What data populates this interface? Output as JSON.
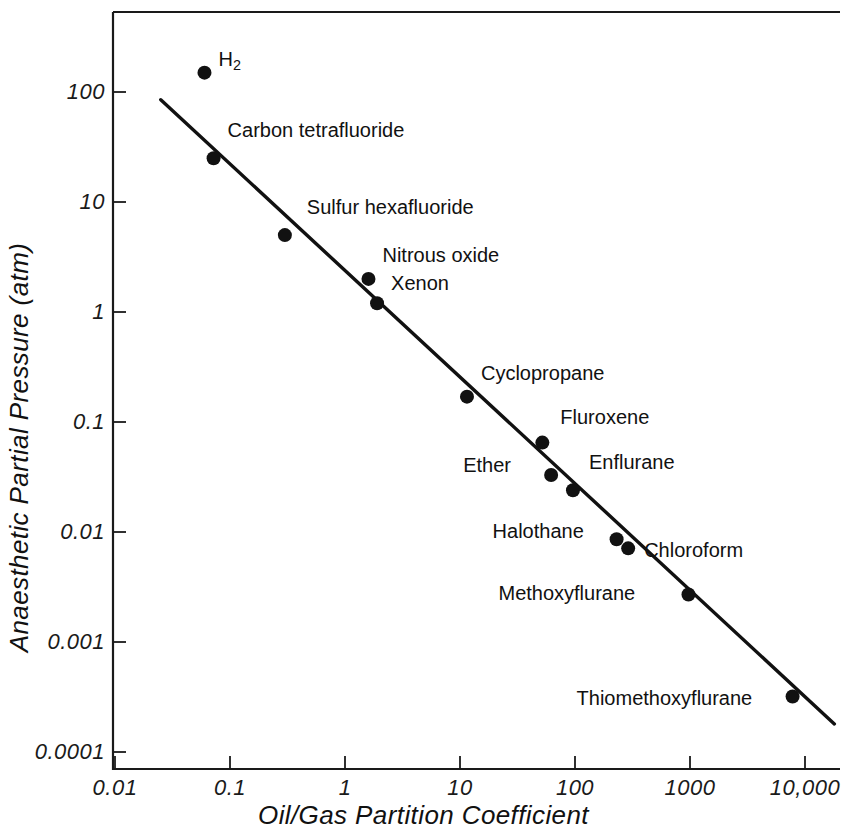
{
  "chart_data": {
    "type": "scatter",
    "title": "",
    "xlabel": "Oil/Gas Partition Coefficient",
    "ylabel": "Anaesthetic Partial Pressure (atm)",
    "xscale": "log",
    "yscale": "log",
    "xlim": [
      0.01,
      30000
    ],
    "ylim": [
      0.0001,
      300
    ],
    "grid": false,
    "legend": "none",
    "x_tick_labels": [
      "0.01",
      "0.1",
      "1",
      "10",
      "100",
      "1000",
      "10,000"
    ],
    "x_tick_values": [
      0.01,
      0.1,
      1,
      10,
      100,
      1000,
      10000
    ],
    "y_tick_labels": [
      "100",
      "10",
      "1",
      "0.1",
      "0.01",
      "0.001",
      "0.0001"
    ],
    "y_tick_values": [
      100,
      10,
      1,
      0.1,
      0.01,
      0.001,
      0.0001
    ],
    "points": [
      {
        "label": "H2",
        "label_html": "H<sub>2</sub>",
        "x": 0.06,
        "y": 150,
        "label_dx": 14,
        "label_dy": -16,
        "on_line": false
      },
      {
        "label": "Carbon tetrafluoride",
        "label_html": "Carbon tetrafluoride",
        "x": 0.072,
        "y": 25,
        "label_dx": 14,
        "label_dy": -30,
        "on_line": true
      },
      {
        "label": "Sulfur hexafluoride",
        "label_html": "Sulfur hexafluoride",
        "x": 0.3,
        "y": 5.0,
        "label_dx": 22,
        "label_dy": -30,
        "on_line": true
      },
      {
        "label": "Nitrous oxide",
        "label_html": "Nitrous oxide",
        "x": 1.6,
        "y": 2.0,
        "label_dx": 14,
        "label_dy": -26,
        "on_line": true
      },
      {
        "label": "Xenon",
        "label_html": "Xenon",
        "x": 1.9,
        "y": 1.2,
        "label_dx": 14,
        "label_dy": -22,
        "on_line": true
      },
      {
        "label": "Cyclopropane",
        "label_html": "Cyclopropane",
        "x": 11.5,
        "y": 0.17,
        "label_dx": 14,
        "label_dy": -26,
        "on_line": true
      },
      {
        "label": "Fluroxene",
        "label_html": "Fluroxene",
        "x": 52,
        "y": 0.065,
        "label_dx": 18,
        "label_dy": -28,
        "on_line": false
      },
      {
        "label": "Ether",
        "label_html": "Ether",
        "x": 62,
        "y": 0.033,
        "label_dx": -88,
        "label_dy": -12,
        "on_line": true
      },
      {
        "label": "Enflurane",
        "label_html": "Enflurane",
        "x": 96,
        "y": 0.024,
        "label_dx": 16,
        "label_dy": -30,
        "on_line": true
      },
      {
        "label": "Halothane",
        "label_html": "Halothane",
        "x": 230,
        "y": 0.0086,
        "label_dx": -124,
        "label_dy": -10,
        "on_line": true
      },
      {
        "label": "Chloroform",
        "label_html": "Chloroform",
        "x": 290,
        "y": 0.0071,
        "label_dx": 16,
        "label_dy": 0,
        "on_line": true
      },
      {
        "label": "Methoxyflurane",
        "label_html": "Methoxyflurane",
        "x": 970,
        "y": 0.0027,
        "label_dx": -190,
        "label_dy": -4,
        "on_line": true
      },
      {
        "label": "Thiomethoxyflurane",
        "label_html": "Thiomethoxyflurane",
        "x": 7800,
        "y": 0.00032,
        "label_dx": -216,
        "label_dy": 0,
        "on_line": true
      }
    ],
    "fit_line": {
      "description": "inverse log-log regression line",
      "x_start": 0.025,
      "y_start": 85,
      "x_end": 18000,
      "y_end": 0.00018
    }
  },
  "axis_titles": {
    "x": "Oil/Gas Partition Coefficient",
    "y": "Anaesthetic Partial Pressure (atm)"
  }
}
